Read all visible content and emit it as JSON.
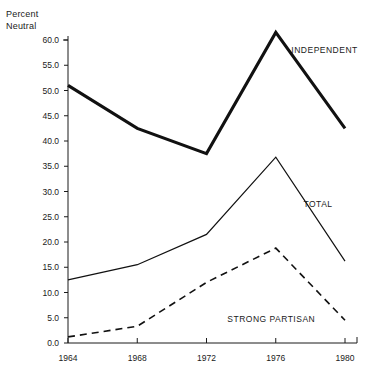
{
  "axis_title": {
    "line1": "Percent",
    "line2": "Neutral"
  },
  "chart_data": {
    "type": "line",
    "title": "",
    "subtitle": "",
    "xlabel": "",
    "ylabel": "Percent Neutral",
    "x": [
      1964,
      1968,
      1972,
      1976,
      1980
    ],
    "xtick_labels": [
      "1964",
      "1968",
      "1972",
      "1976",
      "1980"
    ],
    "ytick_labels": [
      "0.0",
      "5.0",
      "10.0",
      "15.0",
      "20.0",
      "25.0",
      "30.0",
      "35.0",
      "40.0",
      "45.0",
      "50.0",
      "55.0",
      "60.0"
    ],
    "ytick_values": [
      0,
      5,
      10,
      15,
      20,
      25,
      30,
      35,
      40,
      45,
      50,
      55,
      60
    ],
    "ylim": [
      0,
      62
    ],
    "xlim": [
      1964,
      1980
    ],
    "grid": false,
    "legend_position": "inline-right",
    "series": [
      {
        "name": "INDEPENDENT",
        "style": "solid-thick",
        "color": "#111111",
        "values": [
          51.0,
          42.5,
          37.5,
          61.5,
          42.5
        ],
        "label_x": 1976.9,
        "label_y": 57.5
      },
      {
        "name": "TOTAL",
        "style": "solid-thin",
        "color": "#111111",
        "values": [
          12.5,
          15.5,
          21.5,
          36.8,
          16.2
        ],
        "label_x": 1977.6,
        "label_y": 27.0
      },
      {
        "name": "STRONG PARTISAN",
        "style": "dashed",
        "color": "#111111",
        "values": [
          1.2,
          3.3,
          12.0,
          18.8,
          4.5
        ],
        "label_x": 1973.2,
        "label_y": 4.2
      }
    ]
  }
}
